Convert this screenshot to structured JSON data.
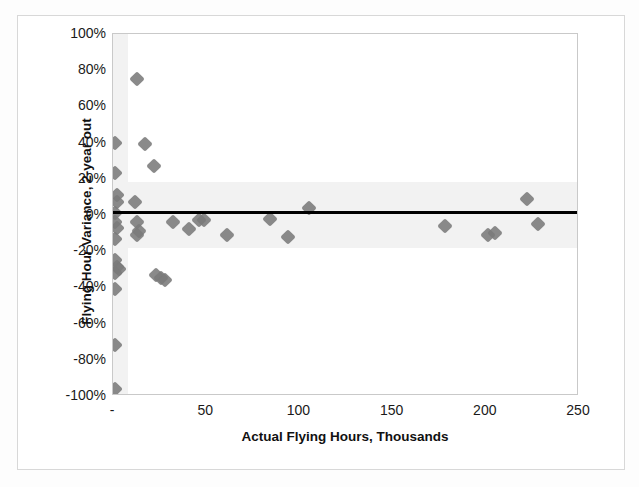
{
  "chart_data": {
    "type": "scatter",
    "title": "",
    "xlabel": "Actual Flying Hours, Thousands",
    "ylabel": "Flying Hour Variance, 2-year out",
    "xlim": [
      0,
      250
    ],
    "ylim": [
      -1.0,
      1.0
    ],
    "xticklabels": [
      "-",
      "50",
      "100",
      "150",
      "200",
      "250"
    ],
    "xtickvalues": [
      0,
      50,
      100,
      150,
      200,
      250
    ],
    "yticklabels": [
      "100%",
      "80%",
      "60%",
      "40%",
      "20%",
      "0%",
      "-20%",
      "-40%",
      "-60%",
      "-80%",
      "-100%"
    ],
    "ytickvalues": [
      1.0,
      0.8,
      0.6,
      0.4,
      0.2,
      0.0,
      -0.2,
      -0.4,
      -0.6,
      -0.8,
      -1.0
    ],
    "grid": false,
    "legend": false,
    "marker": "diamond",
    "marker_color": "#7a7a7a",
    "shaded_band_y": [
      -0.18,
      0.18
    ],
    "shaded_band_x": [
      0,
      8
    ],
    "shaded_band_color": "#f2f2f2",
    "trendline": {
      "color": "#000000",
      "y_at_xmin": 0.012,
      "y_at_xmax": 0.012
    },
    "points": [
      {
        "x": 1,
        "y": 0.4
      },
      {
        "x": 1,
        "y": 0.23
      },
      {
        "x": 2,
        "y": 0.11
      },
      {
        "x": 2,
        "y": 0.07
      },
      {
        "x": 1,
        "y": 0.01
      },
      {
        "x": 1,
        "y": -0.04
      },
      {
        "x": 2,
        "y": -0.07
      },
      {
        "x": 1,
        "y": -0.13
      },
      {
        "x": 1,
        "y": -0.25
      },
      {
        "x": 2,
        "y": -0.29
      },
      {
        "x": 3,
        "y": -0.3
      },
      {
        "x": 1,
        "y": -0.32
      },
      {
        "x": 1,
        "y": -0.41
      },
      {
        "x": 1,
        "y": -0.72
      },
      {
        "x": 1,
        "y": -0.96
      },
      {
        "x": 13,
        "y": 0.75
      },
      {
        "x": 17,
        "y": 0.39
      },
      {
        "x": 22,
        "y": 0.27
      },
      {
        "x": 12,
        "y": 0.07
      },
      {
        "x": 13,
        "y": -0.04
      },
      {
        "x": 14,
        "y": -0.09
      },
      {
        "x": 13,
        "y": -0.11
      },
      {
        "x": 23,
        "y": -0.33
      },
      {
        "x": 26,
        "y": -0.35
      },
      {
        "x": 28,
        "y": -0.36
      },
      {
        "x": 32,
        "y": -0.04
      },
      {
        "x": 41,
        "y": -0.08
      },
      {
        "x": 46,
        "y": -0.03
      },
      {
        "x": 49,
        "y": -0.03
      },
      {
        "x": 61,
        "y": -0.11
      },
      {
        "x": 84,
        "y": -0.02
      },
      {
        "x": 94,
        "y": -0.12
      },
      {
        "x": 105,
        "y": 0.04
      },
      {
        "x": 178,
        "y": -0.06
      },
      {
        "x": 201,
        "y": -0.11
      },
      {
        "x": 205,
        "y": -0.1
      },
      {
        "x": 222,
        "y": 0.09
      },
      {
        "x": 228,
        "y": -0.05
      }
    ]
  }
}
